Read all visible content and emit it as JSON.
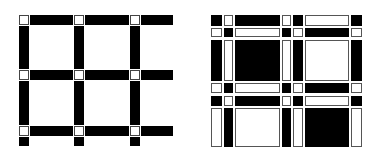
{
  "figures": [
    {
      "id": "open-grid",
      "description": "Open lattice of black bars joined by small white square nodes",
      "columns_x": [
        19,
        74,
        130
      ],
      "rows_y": [
        15,
        70,
        126
      ],
      "node_size": 10,
      "bar_thickness": 10,
      "bar_end_x": 173,
      "bottom_stub_end_y": 146,
      "colors": {
        "bar": "#000000",
        "node": "#ffffff",
        "node_border": "#444444"
      }
    },
    {
      "id": "checker-weave",
      "description": "Woven checkerboard grid alternating black and white cells",
      "col_edges": [
        [
          211,
          222
        ],
        [
          224,
          233
        ],
        [
          235,
          280
        ],
        [
          282,
          291
        ],
        [
          293,
          303
        ],
        [
          305,
          349
        ],
        [
          351,
          362
        ]
      ],
      "row_edges": [
        [
          15,
          26
        ],
        [
          28,
          37
        ],
        [
          40,
          81
        ],
        [
          83,
          93
        ],
        [
          96,
          106
        ],
        [
          108,
          147
        ]
      ],
      "pattern": [
        [
          "B",
          "W",
          "B",
          "W",
          "B",
          "W",
          "B"
        ],
        [
          "W",
          "B",
          "W",
          "B",
          "W",
          "B",
          "W"
        ],
        [
          "B",
          "W",
          "B",
          "W",
          "B",
          "W",
          "B"
        ],
        [
          "W",
          "B",
          "W",
          "B",
          "W",
          "B",
          "W"
        ],
        [
          "B",
          "W",
          "B",
          "W",
          "B",
          "W",
          "B"
        ],
        [
          "W",
          "B",
          "W",
          "B",
          "W",
          "B",
          "W"
        ]
      ],
      "colors": {
        "black": "#000000",
        "white": "#ffffff",
        "border": "#555555"
      }
    }
  ]
}
